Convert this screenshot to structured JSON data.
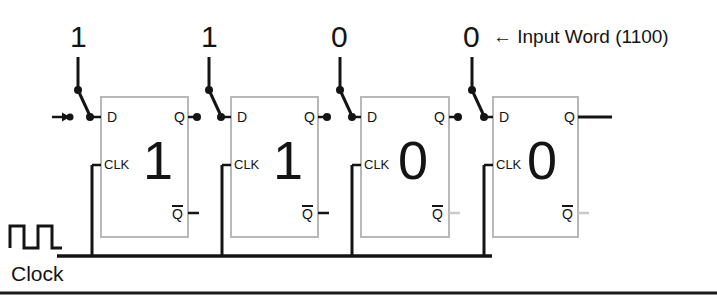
{
  "diagram": {
    "title_annotation": "← Input Word (1100)",
    "clock_label": "Clock",
    "input_bits": [
      {
        "value": "1"
      },
      {
        "value": "1"
      },
      {
        "value": "0"
      },
      {
        "value": "0"
      }
    ],
    "flipflops": [
      {
        "stored_value": "1",
        "d_label": "D",
        "clk_label": "CLK",
        "q_label": "Q",
        "qbar_label": "Q"
      },
      {
        "stored_value": "1",
        "d_label": "D",
        "clk_label": "CLK",
        "q_label": "Q",
        "qbar_label": "Q"
      },
      {
        "stored_value": "0",
        "d_label": "D",
        "clk_label": "CLK",
        "q_label": "Q",
        "qbar_label": "Q"
      },
      {
        "stored_value": "0",
        "d_label": "D",
        "clk_label": "CLK",
        "q_label": "Q",
        "qbar_label": "Q"
      }
    ],
    "colors": {
      "wire": "#141414",
      "box_outline": "#b8b8b8",
      "text": "#141414",
      "background": "#ffffff",
      "footer_rule": "#1a1a1a"
    }
  }
}
